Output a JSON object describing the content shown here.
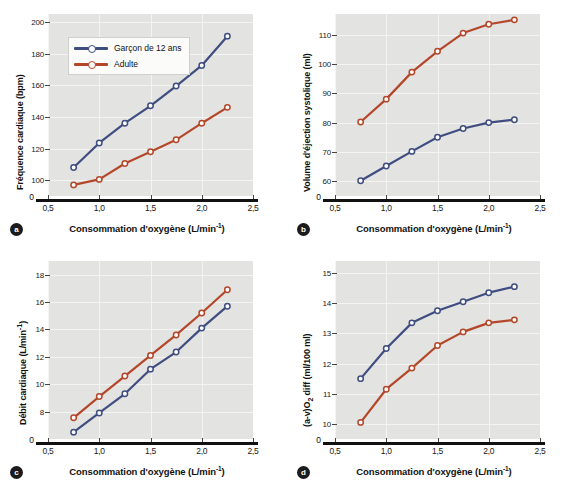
{
  "figure": {
    "legend": {
      "entries": [
        {
          "label": "Garçon de 12 ans",
          "color": "#3f4d80"
        },
        {
          "label": "Adulte",
          "color": "#b4472a"
        }
      ]
    },
    "series_colors": {
      "boy": "#3f4d80",
      "adult": "#b4472a"
    },
    "shared_x": {
      "label": "Consommation d'oxygène (L/min",
      "label_sup": "-1",
      "label_tail": ")",
      "ticks": [
        "0,5",
        "1,0",
        "1,5",
        "2,0",
        "2,5"
      ],
      "tick_values": [
        0.5,
        1.0,
        1.5,
        2.0,
        2.5
      ],
      "xlim": [
        0.5,
        2.5
      ]
    },
    "panels": [
      {
        "badge": "a"
      },
      {
        "badge": "b"
      },
      {
        "badge": "c"
      },
      {
        "badge": "d"
      }
    ]
  },
  "chart_data": [
    {
      "type": "line",
      "panel": "a",
      "title": "",
      "xlabel": "Consommation d'oxygène (L/min-1)",
      "ylabel": "Fréquence cardiaque (bpm)",
      "ylabel_plain": "Fréquence cardiaque (bpm)",
      "x": [
        0.75,
        1.0,
        1.25,
        1.5,
        1.75,
        2.0,
        2.25
      ],
      "xlim": [
        0.5,
        2.5
      ],
      "ylim": [
        90,
        205
      ],
      "yticks": [
        100,
        120,
        140,
        160,
        180,
        200
      ],
      "ytick_labels": [
        "100",
        "120",
        "140",
        "160",
        "180",
        "200"
      ],
      "zero_label": "0",
      "axis_break": true,
      "grid": true,
      "legend_position": "upper-left",
      "series": [
        {
          "name": "Garçon de 12 ans",
          "color": "#3f4d80",
          "values": [
            108,
            123.5,
            136,
            147,
            159.5,
            172.5,
            191
          ]
        },
        {
          "name": "Adulte",
          "color": "#b4472a",
          "values": [
            97,
            100.5,
            110.5,
            118,
            125.5,
            136,
            146
          ]
        }
      ]
    },
    {
      "type": "line",
      "panel": "b",
      "title": "",
      "xlabel": "Consommation d'oxygène (L/min-1)",
      "ylabel": "Volume d'éjection systolique (ml)",
      "ylabel_plain": "Volume d'éjection systolique (ml)",
      "x": [
        0.75,
        1.0,
        1.25,
        1.5,
        1.75,
        2.0,
        2.25
      ],
      "xlim": [
        0.5,
        2.5
      ],
      "ylim": [
        55,
        117
      ],
      "yticks": [
        60,
        70,
        80,
        90,
        100,
        110
      ],
      "ytick_labels": [
        "60",
        "70",
        "80",
        "90",
        "100",
        "110"
      ],
      "zero_label": "0",
      "axis_break": true,
      "grid": true,
      "legend_position": "none",
      "series": [
        {
          "name": "Garçon de 12 ans",
          "color": "#3f4d80",
          "values": [
            60.2,
            65.2,
            70.2,
            75.0,
            78.0,
            80.0,
            81.0
          ]
        },
        {
          "name": "Adulte",
          "color": "#b4472a",
          "values": [
            80.2,
            88.0,
            97.2,
            104.3,
            110.5,
            113.5,
            115.0
          ]
        }
      ]
    },
    {
      "type": "line",
      "panel": "c",
      "title": "",
      "xlabel": "Consommation d'oxygène (L/min-1)",
      "ylabel": "Débit cardiaque (L/min-1)",
      "ylabel_plain": "Débit cardiaque (L/min",
      "ylabel_sup": "-1",
      "ylabel_tail": ")",
      "x": [
        0.75,
        1.0,
        1.25,
        1.5,
        1.75,
        2.0,
        2.25
      ],
      "xlim": [
        0.5,
        2.5
      ],
      "ylim": [
        6.0,
        19.0
      ],
      "yticks": [
        8,
        10,
        12,
        14,
        16,
        18
      ],
      "ytick_labels": [
        "8",
        "10",
        "12",
        "14",
        "16",
        "18"
      ],
      "zero_label": "0",
      "axis_break": true,
      "grid": true,
      "legend_position": "none",
      "series": [
        {
          "name": "Garçon de 12 ans",
          "color": "#3f4d80",
          "values": [
            6.5,
            7.9,
            9.3,
            11.1,
            12.35,
            14.1,
            15.7
          ]
        },
        {
          "name": "Adulte",
          "color": "#b4472a",
          "values": [
            7.55,
            9.1,
            10.6,
            12.1,
            13.6,
            15.2,
            16.9
          ]
        }
      ]
    },
    {
      "type": "line",
      "panel": "d",
      "title": "",
      "xlabel": "Consommation d'oxygène (L/min-1)",
      "ylabel": "(a-v)O2 diff (ml/100 ml)",
      "ylabel_plain": "(a-v)O",
      "ylabel_sub": "2",
      "ylabel_tail": " diff (ml/100 ml)",
      "x": [
        0.75,
        1.0,
        1.25,
        1.5,
        1.75,
        2.0,
        2.25
      ],
      "xlim": [
        0.5,
        2.5
      ],
      "ylim": [
        9.5,
        15.4
      ],
      "yticks": [
        10,
        11,
        12,
        13,
        14,
        15
      ],
      "ytick_labels": [
        "10",
        "11",
        "12",
        "13",
        "14",
        "15"
      ],
      "zero_label": "0",
      "axis_break": true,
      "grid": true,
      "legend_position": "none",
      "series": [
        {
          "name": "Garçon de 12 ans",
          "color": "#3f4d80",
          "values": [
            11.5,
            12.5,
            13.35,
            13.75,
            14.05,
            14.35,
            14.55
          ]
        },
        {
          "name": "Adulte",
          "color": "#b4472a",
          "values": [
            10.05,
            11.15,
            11.85,
            12.6,
            13.05,
            13.35,
            13.45
          ]
        }
      ]
    }
  ]
}
